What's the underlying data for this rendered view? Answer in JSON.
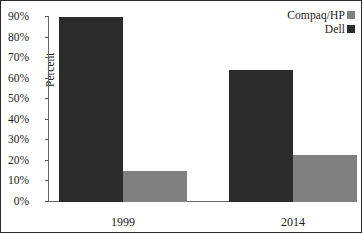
{
  "chart_data": {
    "type": "bar",
    "title": "",
    "xlabel": "",
    "ylabel": "Percent",
    "categories": [
      "1999",
      "2014"
    ],
    "ylim": [
      0,
      90
    ],
    "ytick_labels": [
      "0%",
      "10%",
      "20%",
      "30%",
      "40%",
      "50%",
      "60%",
      "70%",
      "80%",
      "90%"
    ],
    "ytick_values": [
      0,
      10,
      20,
      30,
      40,
      50,
      60,
      70,
      80,
      90
    ],
    "grid": false,
    "legend_position": "top-right",
    "series": [
      {
        "name": "Dell",
        "color": "#2c2c2c",
        "values": [
          90,
          64
        ]
      },
      {
        "name": "Compaq/HP",
        "color": "#808080",
        "values": [
          15,
          23
        ]
      }
    ]
  },
  "legend": {
    "items": [
      {
        "label": "Compaq/HP",
        "color": "#808080"
      },
      {
        "label": "Dell",
        "color": "#2c2c2c"
      }
    ]
  }
}
